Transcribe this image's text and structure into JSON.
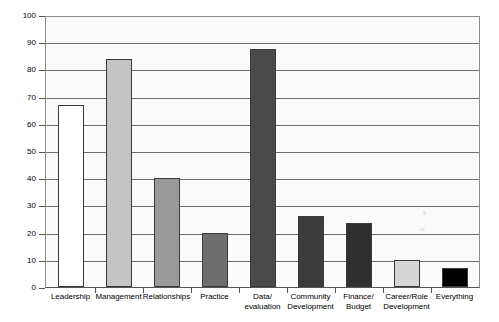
{
  "chart_data": {
    "type": "bar",
    "title": "",
    "xlabel": "",
    "ylabel": "Number of comments",
    "ylim": [
      0,
      100
    ],
    "ytick_step": 10,
    "yticks": [
      0,
      10,
      20,
      30,
      40,
      50,
      60,
      70,
      80,
      90,
      100
    ],
    "grid": true,
    "legend": false,
    "categories": [
      "Leadership",
      "Management",
      "Relationships",
      "Practice",
      "Data/ evaluation",
      "Community Development",
      "Finance/ Budget",
      "Career/Role Development",
      "Everything"
    ],
    "category_lines": [
      [
        "Leadership"
      ],
      [
        "Management"
      ],
      [
        "Relationships"
      ],
      [
        "Practice"
      ],
      [
        "Data/",
        "evaluation"
      ],
      [
        "Community",
        "Development"
      ],
      [
        "Finance/",
        "Budget"
      ],
      [
        "Career/Role",
        "Development"
      ],
      [
        "Everything"
      ]
    ],
    "values": [
      67,
      84,
      40,
      20,
      87.5,
      26,
      23.5,
      10,
      7
    ],
    "bar_colors": [
      "#ffffff",
      "#c4c4c4",
      "#9a9a9a",
      "#6e6e6e",
      "#4a4a4a",
      "#3c3c3c",
      "#2f2f2f",
      "#d6d6d6",
      "#000000"
    ],
    "bar_edge_color": "#3a3a3a",
    "plot_background": "#fbfbfb",
    "gridline_color": "#6e6e6e",
    "axis_color": "#555555"
  }
}
